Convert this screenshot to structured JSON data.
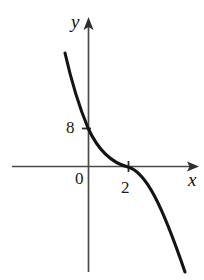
{
  "figure": {
    "name": "cartesian-graph-decreasing-curve",
    "background_color": "#ffffff",
    "ink_color": "#1a1a1a",
    "axis_color": "#444444",
    "curve_color": "#111111"
  },
  "axes": {
    "x_axis": {
      "label": "x",
      "arrow": "right",
      "pixel_y": 166,
      "pixel_x_start": 12,
      "pixel_x_end": 198
    },
    "y_axis": {
      "label": "y",
      "arrow": "up",
      "pixel_x": 88,
      "pixel_y_start": 18,
      "pixel_y_end": 272
    },
    "origin_label": "0"
  },
  "ticks": {
    "y_ticks": [
      {
        "label": "8",
        "value": 8,
        "pixel_y": 128
      }
    ],
    "x_ticks": [
      {
        "label": "2",
        "value": 2,
        "pixel_x": 128
      }
    ]
  },
  "chart_data": {
    "type": "line",
    "title": "",
    "xlabel": "x",
    "ylabel": "y",
    "grid": false,
    "legend": null,
    "annotations": [
      "0",
      "8",
      "2"
    ],
    "xlim": [
      -1.2,
      5.5
    ],
    "ylim": [
      -13,
      18
    ],
    "intercepts": {
      "y_intercept": 8,
      "x_intercept": 2
    },
    "series": [
      {
        "name": "curve",
        "x": [
          -0.6,
          -0.4,
          -0.2,
          0.0,
          0.3,
          0.6,
          0.9,
          1.2,
          1.5,
          1.8,
          2.0,
          2.3,
          2.6,
          2.9,
          3.2,
          3.6,
          4.0,
          4.4,
          4.8
        ],
        "y": [
          17.0,
          14.2,
          11.2,
          8.0,
          5.4,
          3.6,
          2.3,
          1.4,
          0.8,
          0.3,
          0.0,
          -0.6,
          -1.4,
          -2.4,
          -3.6,
          -5.6,
          -8.0,
          -10.6,
          -13.0
        ]
      }
    ],
    "curve_pixel_path": "M 65,53 C 70,75 78,104 88,128 C 99,152 112,163 128,167 C 146,172 162,205 185,272"
  }
}
